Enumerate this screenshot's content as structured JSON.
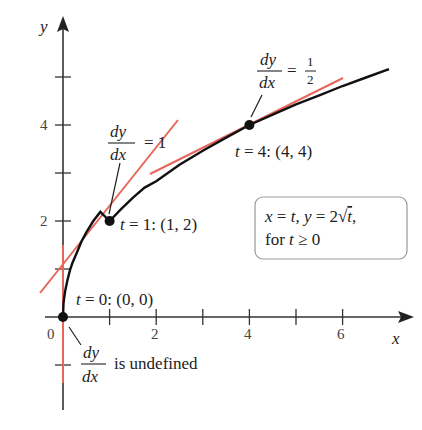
{
  "figure": {
    "axes": {
      "x_label": "x",
      "y_label": "y",
      "origin_label": "0",
      "x_tick_labels": [
        "2",
        "4",
        "6"
      ],
      "y_tick_labels": [
        "2",
        "4"
      ]
    },
    "curve": {
      "equation_line1": "x = t, y = 2√t,",
      "equation_line2": "for t ≥ 0",
      "color": "#111111"
    },
    "points": [
      {
        "label": "t = 0: (0, 0)",
        "x": 0,
        "y": 0
      },
      {
        "label": "t = 1: (1, 2)",
        "x": 1,
        "y": 2
      },
      {
        "label": "t = 4: (4, 4)",
        "x": 4,
        "y": 4
      }
    ],
    "slope_annotations": [
      {
        "numerator": "dy",
        "denominator": "dx",
        "rhs": "= 1"
      },
      {
        "numerator": "dy",
        "denominator": "dx",
        "rhs_prefix": "=",
        "rhs_num": "1",
        "rhs_den": "2"
      },
      {
        "numerator": "dy",
        "denominator": "dx",
        "rhs": "is undefined"
      }
    ],
    "tangent_color": "#e8665a"
  }
}
